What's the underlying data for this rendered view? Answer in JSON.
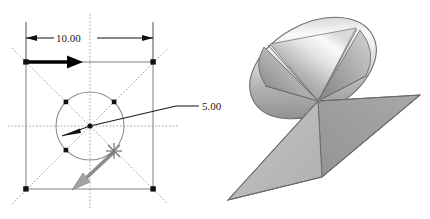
{
  "figure": {
    "title": "",
    "background_color": "#ffffff",
    "panels": [
      {
        "name": "left-panel-2d-dimensioned-sketch",
        "description": "2D dimensioned square sketch with inscribed circle, diagonal construction lines, and directional vectors"
      },
      {
        "name": "right-panel-3d-double-cone",
        "description": "Shaded 3D double-napped cone with elliptical upper nappe and rhombic lower nappe"
      }
    ]
  },
  "left_diagram": {
    "dimensions": [
      {
        "id": "width-dimension",
        "label": "10.00",
        "orientation": "horizontal",
        "position": "top"
      },
      {
        "id": "radius-dimension",
        "label": "5.00",
        "orientation": "leader",
        "position": "right-of-circle"
      }
    ],
    "square": {
      "name": "outer-square",
      "stroke_color": "#8a8a8a",
      "corner_marker_color": "#111111",
      "corner_count": 4
    },
    "circle": {
      "name": "inscribed-circle",
      "stroke_color": "#8a8a8a",
      "point_marker_count": 4,
      "point_marker_color": "#111111"
    },
    "construction_lines": {
      "name": "dotted-construction-lines",
      "color": "#9a9a9a",
      "style": "dotted",
      "count": 4
    },
    "vectors": [
      {
        "id": "primary-vector-black",
        "color": "#000000",
        "direction": "right",
        "origin": "top-left-corner"
      },
      {
        "id": "secondary-vector-gray",
        "color": "#8c8c8c",
        "direction": "down-left",
        "origin": "lower-circle-point"
      }
    ],
    "markers": [
      {
        "id": "star-marker",
        "color": "#7a7a7a",
        "shape": "asterisk"
      },
      {
        "id": "center-marker",
        "color": "#111111",
        "shape": "dot"
      }
    ]
  },
  "right_model": {
    "name": "double-napped-cone",
    "upper_nappe": {
      "id": "upper-cone-ellipse",
      "shape": "ellipse",
      "highlight_color": "#fbfbfb",
      "mid_color": "#b6b6b6",
      "shadow_color": "#8f8f8f",
      "edge_color": "#6e6e6e"
    },
    "lower_nappe": {
      "id": "lower-cone-rhombus",
      "shape": "rhombus",
      "left_face_color": "#b9b9b9",
      "right_face_color": "#a0a0a0",
      "edge_color": "#6b6b6b"
    },
    "apex": {
      "id": "cone-apex",
      "color": "#7c7c7c"
    }
  },
  "colors": {
    "background": "#ffffff",
    "line_gray": "#8a8a8a",
    "dot_gray": "#9a9a9a",
    "ink_black": "#111111",
    "accent_gray": "#8c8c8c"
  }
}
